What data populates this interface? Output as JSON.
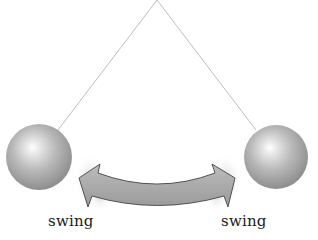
{
  "diagram": {
    "type": "pendulum-swing",
    "pivot": {
      "x": 157,
      "y": 0
    },
    "string_color": "#bdbdbd",
    "bobs": [
      {
        "name": "left-bob",
        "cx": 39,
        "cy": 157,
        "r": 33
      },
      {
        "name": "right-bob",
        "cx": 276,
        "cy": 157,
        "r": 32
      }
    ],
    "bob_colors": {
      "highlight": "#ffffff",
      "mid": "#b8b8b8",
      "edge": "#8e8e8e"
    },
    "arrow": {
      "style": "double-headed curved",
      "fill": "#a9a9a9",
      "stroke": "#444444"
    },
    "motion_blur_color": "#d0d0d0"
  },
  "labels": {
    "left": "swing",
    "right": "swing"
  }
}
